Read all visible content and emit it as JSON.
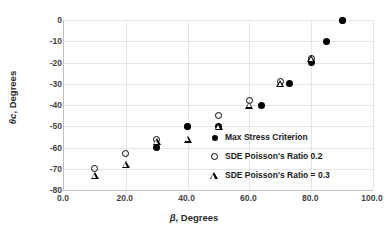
{
  "chart_data": {
    "type": "scatter",
    "title": "",
    "xlabel": "β, Degrees",
    "ylabel": "θc, Degrees",
    "xlim": [
      0,
      100
    ],
    "ylim": [
      -80,
      0
    ],
    "xticks": [
      "0.0",
      "20.0",
      "40.0",
      "60.0",
      "80.0",
      "100.0"
    ],
    "xtick_values": [
      0,
      20,
      40,
      60,
      80,
      100
    ],
    "yticks": [
      "0",
      "-10",
      "-20",
      "-30",
      "-40",
      "-50",
      "-60",
      "-70",
      "-80"
    ],
    "ytick_values": [
      0,
      -10,
      -20,
      -30,
      -40,
      -50,
      -60,
      -70,
      -80
    ],
    "grid": true,
    "legend_position": "inside-bottom-right",
    "series": [
      {
        "name": "Max Stress Criterion",
        "marker": "filled-circle",
        "color": "#000000",
        "points": [
          [
            30,
            -60
          ],
          [
            40,
            -50
          ],
          [
            50,
            -50
          ],
          [
            64,
            -40
          ],
          [
            73,
            -30
          ],
          [
            80,
            -20
          ],
          [
            85,
            -10
          ],
          [
            90,
            0
          ]
        ]
      },
      {
        "name": "SDE Poisson's Ratio 0.2",
        "marker": "open-circle",
        "color": "#000000",
        "points": [
          [
            10,
            -70
          ],
          [
            20,
            -63
          ],
          [
            30,
            -56
          ],
          [
            40,
            -50
          ],
          [
            50,
            -45
          ],
          [
            60,
            -38
          ],
          [
            70,
            -29
          ],
          [
            80,
            -18
          ],
          [
            90,
            0
          ]
        ]
      },
      {
        "name": "SDE Poisson's Ratio = 0.3",
        "marker": "open-triangle",
        "color": "#000000",
        "points": [
          [
            10,
            -73
          ],
          [
            20,
            -68
          ],
          [
            30,
            -57
          ],
          [
            40,
            -56
          ],
          [
            50,
            -50
          ],
          [
            60,
            -40
          ],
          [
            70,
            -30
          ],
          [
            80,
            -18
          ]
        ]
      }
    ]
  },
  "legend": {
    "items": [
      {
        "label": "Max Stress Criterion",
        "marker": "filled-circle"
      },
      {
        "label": "SDE Poisson's Ratio 0.2",
        "marker": "open-circle"
      },
      {
        "label": "SDE Poisson's Ratio = 0.3",
        "marker": "open-triangle"
      }
    ]
  },
  "axis_titles": {
    "x_symbol": "β",
    "x_rest": ", Degrees",
    "y_symbol": "θ",
    "y_sub": "c",
    "y_rest": ", Degrees"
  }
}
